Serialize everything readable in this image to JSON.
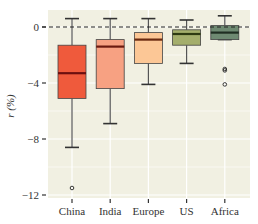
{
  "chart_data": {
    "type": "box",
    "title": "",
    "xlabel": "",
    "ylabel": "r (%)",
    "ylim": [
      -12.2,
      1.2
    ],
    "yticks": [
      0,
      -4,
      -8,
      -12
    ],
    "ytick_labels": [
      "0",
      "−4",
      "−8",
      "−12"
    ],
    "grid": true,
    "reference_line": {
      "y": 0,
      "style": "dashed",
      "color": "#222222"
    },
    "legend": null,
    "categories": [
      "China",
      "India",
      "Europe",
      "US",
      "Africa"
    ],
    "series": [
      {
        "name": "China",
        "whisker_high": 0.6,
        "q3": -1.3,
        "median": -3.3,
        "q1": -5.1,
        "whisker_low": -8.6,
        "outliers": [
          -11.5
        ],
        "fill": "#ef5a3c",
        "median_color": "#6b0f0f"
      },
      {
        "name": "India",
        "whisker_high": 0.6,
        "q3": -0.9,
        "median": -1.4,
        "q1": -4.4,
        "whisker_low": -6.9,
        "outliers": [],
        "fill": "#f7a182",
        "median_color": "#6b1a10"
      },
      {
        "name": "Europe",
        "whisker_high": 0.6,
        "q3": -0.4,
        "median": -0.9,
        "q1": -2.6,
        "whisker_low": -4.1,
        "outliers": [],
        "fill": "#fcc796",
        "median_color": "#6b2a10"
      },
      {
        "name": "US",
        "whisker_high": 0.5,
        "q3": -0.2,
        "median": -0.5,
        "q1": -1.3,
        "whisker_low": -2.6,
        "outliers": [],
        "fill": "#a4ae6c",
        "median_color": "#2e3a12"
      },
      {
        "name": "Africa",
        "whisker_high": 0.8,
        "q3": 0.1,
        "median": -0.4,
        "q1": -0.9,
        "whisker_low": -0.9,
        "outliers": [
          -3.0,
          -3.1,
          -4.1
        ],
        "fill": "#6e8a72",
        "median_color": "#1f2e22"
      }
    ]
  },
  "colors": {
    "panel_background": "#f1f0e2",
    "grid": "#ffffff",
    "box_stroke": "#444444",
    "whisker": "#555555"
  }
}
